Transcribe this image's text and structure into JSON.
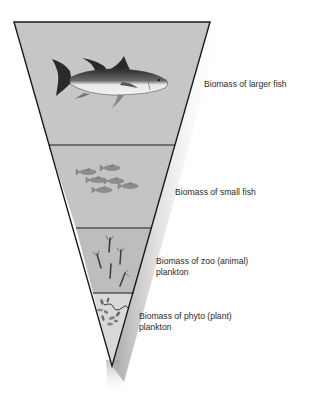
{
  "diagram": {
    "type": "inverted-biomass-pyramid",
    "colors": {
      "fill_upper": "#c6c6c6",
      "fill_zoo": "#bdbdbd",
      "fill_phyto": "#d9d9d9",
      "outline": "#1a1a1a",
      "text": "#2a2a2a"
    },
    "levels": [
      {
        "id": "larger-fish",
        "label_line1": "Biomass of larger fish",
        "label_line2": "",
        "icon": "tuna-icon"
      },
      {
        "id": "small-fish",
        "label_line1": "Biomass of small fish",
        "label_line2": "",
        "icon": "small-fish-school-icon"
      },
      {
        "id": "zooplankton",
        "label_line1": "Biomass of zoo (animal)",
        "label_line2": "plankton",
        "icon": "zooplankton-icon"
      },
      {
        "id": "phytoplankton",
        "label_line1": "Biomass of phyto (plant)",
        "label_line2": "plankton",
        "icon": "phytoplankton-icon"
      }
    ]
  }
}
